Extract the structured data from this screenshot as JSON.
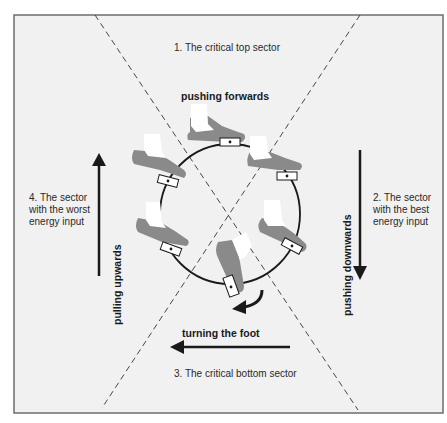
{
  "diagram": {
    "colors": {
      "background": "#f1f1f1",
      "frame": "#6e6e6e",
      "line": "#1a1a1a",
      "shoe": "#8a8a8a",
      "sock": "#ffffff"
    },
    "sectors": {
      "top": "1.  The critical top sector",
      "right": [
        "2.  The sector",
        "with the best",
        "energy input"
      ],
      "bottom": "3.  The critical bottom sector",
      "left": [
        "4.  The sector",
        "with the worst",
        "energy input"
      ]
    },
    "actions": {
      "top": "pushing forwards",
      "right": "pushing downwards",
      "bottom": "turning the foot",
      "left": "pulling upwards"
    },
    "icons": {
      "up_arrow": "arrow-up-icon",
      "down_arrow": "arrow-down-icon",
      "left_arrow": "arrow-left-icon",
      "curved_arrow": "curved-arrow-icon",
      "pedal": "pedal-icon",
      "foot": "foot-icon"
    }
  }
}
